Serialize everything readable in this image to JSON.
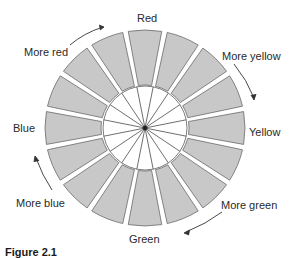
{
  "diagram": {
    "type": "color-wheel",
    "segment_count": 16,
    "center": [
      145,
      128
    ],
    "outer_radius": [
      100,
      98
    ],
    "ring_inner_radius": [
      44,
      43
    ],
    "disc_radius": 42,
    "colors": {
      "segment_fill": "#c8c8c8",
      "segment_stroke": "#5a5a5a",
      "disc_fill": "#ffffff",
      "spoke": "#4a4a4a",
      "hub": "#222222",
      "text": "#2a2a2a",
      "arrow": "#333333"
    },
    "labels": {
      "red": "Red",
      "more_red": "More red",
      "more_yellow": "More yellow",
      "yellow": "Yellow",
      "blue": "Blue",
      "more_blue": "More blue",
      "more_green": "More green",
      "green": "Green"
    },
    "caption": "Figure 2.1"
  }
}
